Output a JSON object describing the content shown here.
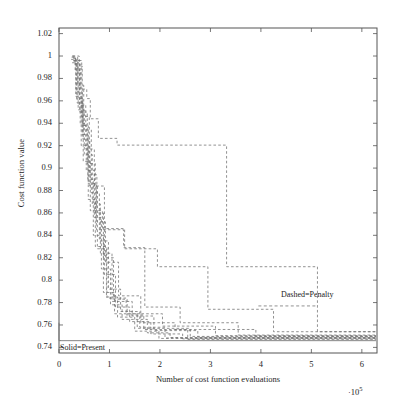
{
  "figure": {
    "background": "#ffffff",
    "frame_color": "#555555",
    "dashed_color": "#6e6e6e",
    "solid_color": "#777777"
  },
  "axes": {
    "y_label": "Cost function value",
    "x_label": "Number of cost function evaluations",
    "x_multiplier_prefix": "·",
    "x_multiplier_base": "10",
    "x_multiplier_exp": "5",
    "y_ticks": [
      "0.74",
      "0.76",
      "0.78",
      "0.8",
      "0.82",
      "0.84",
      "0.86",
      "0.88",
      "0.9",
      "0.92",
      "0.94",
      "0.96",
      "0.98",
      "1",
      "1.02"
    ],
    "x_ticks": [
      "0",
      "1",
      "2",
      "3",
      "4",
      "5",
      "6"
    ]
  },
  "annotations": [
    {
      "id": "dashed-penalty",
      "text": "Dashed=Penalty"
    },
    {
      "id": "solid-present",
      "text": "Solid=Present"
    }
  ],
  "chart_data": {
    "type": "line",
    "title": "",
    "xlabel": "Number of cost function evaluations",
    "ylabel": "Cost function value",
    "xlim": [
      0,
      6.3
    ],
    "ylim": [
      0.735,
      1.025
    ],
    "x_scale_multiplier": 100000,
    "grid": false,
    "legend": {
      "position": "inside-plot",
      "entries": [
        {
          "label": "Dashed=Penalty",
          "style": "dashed"
        },
        {
          "label": "Solid=Present",
          "style": "solid"
        }
      ]
    },
    "note": "Monotone decreasing staircase convergence histories. x in units of 1e5 cost function evaluations; y is cost function value.",
    "series": [
      {
        "name": "penalty-run-1",
        "style": "dashed",
        "x": [
          0.26,
          0.32,
          0.32,
          0.42,
          0.42,
          0.55,
          0.55,
          0.62,
          0.62,
          0.78,
          0.78,
          1.15,
          1.15,
          3.32,
          3.32,
          5.12,
          5.12,
          6.28
        ],
        "y": [
          1.0,
          1.0,
          0.9875,
          0.9875,
          0.9705,
          0.9705,
          0.962,
          0.962,
          0.944,
          0.944,
          0.9265,
          0.9265,
          0.9205,
          0.9205,
          0.812,
          0.812,
          0.754,
          0.754
        ]
      },
      {
        "name": "penalty-run-2",
        "style": "dashed",
        "x": [
          0.27,
          0.4,
          0.4,
          0.53,
          0.53,
          0.7,
          0.7,
          0.9,
          0.9,
          1.3,
          1.3,
          1.95,
          1.95,
          2.95,
          2.95,
          4.25,
          4.25,
          6.28
        ],
        "y": [
          1.0,
          1.0,
          0.956,
          0.956,
          0.917,
          0.917,
          0.884,
          0.884,
          0.846,
          0.846,
          0.828,
          0.828,
          0.812,
          0.812,
          0.774,
          0.774,
          0.754,
          0.754
        ]
      },
      {
        "name": "penalty-run-3",
        "style": "dashed",
        "x": [
          0.28,
          0.36,
          0.36,
          0.48,
          0.48,
          0.62,
          0.62,
          0.86,
          0.86,
          1.28,
          1.28,
          1.7,
          1.7,
          2.4,
          2.4,
          3.55,
          3.55,
          6.28
        ],
        "y": [
          0.998,
          0.998,
          0.958,
          0.958,
          0.906,
          0.906,
          0.862,
          0.862,
          0.845,
          0.845,
          0.829,
          0.829,
          0.776,
          0.776,
          0.762,
          0.762,
          0.751,
          0.751
        ]
      },
      {
        "name": "penalty-run-4",
        "style": "dashed",
        "x": [
          0.25,
          0.33,
          0.33,
          0.44,
          0.44,
          0.58,
          0.58,
          0.72,
          0.72,
          0.95,
          0.95,
          1.35,
          1.35,
          2.05,
          2.05,
          3.1,
          3.1,
          6.28
        ],
        "y": [
          0.999,
          0.999,
          0.964,
          0.964,
          0.92,
          0.92,
          0.872,
          0.872,
          0.83,
          0.83,
          0.784,
          0.784,
          0.77,
          0.77,
          0.759,
          0.759,
          0.7505,
          0.7505
        ]
      },
      {
        "name": "penalty-run-5",
        "style": "dashed",
        "x": [
          0.3,
          0.45,
          0.45,
          0.6,
          0.6,
          0.75,
          0.75,
          0.92,
          0.92,
          1.18,
          1.18,
          1.62,
          1.62,
          2.3,
          2.3,
          3.9,
          3.9,
          6.28
        ],
        "y": [
          0.996,
          0.996,
          0.946,
          0.946,
          0.894,
          0.894,
          0.852,
          0.852,
          0.816,
          0.816,
          0.786,
          0.786,
          0.762,
          0.762,
          0.756,
          0.756,
          0.75,
          0.75
        ]
      },
      {
        "name": "penalty-run-6",
        "style": "dashed",
        "x": [
          0.24,
          0.34,
          0.34,
          0.46,
          0.46,
          0.57,
          0.57,
          0.68,
          0.68,
          0.88,
          0.88,
          1.1,
          1.1,
          1.55,
          1.55,
          2.6,
          2.6,
          6.28
        ],
        "y": [
          0.997,
          0.997,
          0.968,
          0.968,
          0.93,
          0.93,
          0.89,
          0.89,
          0.84,
          0.84,
          0.789,
          0.789,
          0.77,
          0.77,
          0.757,
          0.757,
          0.7498,
          0.7498
        ]
      },
      {
        "name": "penalty-run-7",
        "style": "dashed",
        "x": [
          0.29,
          0.38,
          0.38,
          0.5,
          0.5,
          0.66,
          0.66,
          0.82,
          0.82,
          1.05,
          1.05,
          1.45,
          1.45,
          1.88,
          1.88,
          2.75,
          2.75,
          6.28
        ],
        "y": [
          0.995,
          0.995,
          0.952,
          0.952,
          0.912,
          0.912,
          0.868,
          0.868,
          0.824,
          0.824,
          0.781,
          0.781,
          0.768,
          0.768,
          0.755,
          0.755,
          0.7492,
          0.7492
        ]
      },
      {
        "name": "penalty-run-8",
        "style": "dashed",
        "x": [
          0.31,
          0.42,
          0.42,
          0.54,
          0.54,
          0.7,
          0.7,
          0.84,
          0.84,
          1.02,
          1.02,
          1.25,
          1.25,
          1.75,
          1.75,
          2.2,
          2.2,
          6.28
        ],
        "y": [
          0.993,
          0.993,
          0.94,
          0.94,
          0.898,
          0.898,
          0.856,
          0.856,
          0.81,
          0.81,
          0.778,
          0.778,
          0.765,
          0.765,
          0.753,
          0.753,
          0.7488,
          0.7488
        ]
      },
      {
        "name": "penalty-run-9",
        "style": "dashed",
        "x": [
          0.27,
          0.37,
          0.37,
          0.49,
          0.49,
          0.64,
          0.64,
          0.8,
          0.8,
          0.98,
          0.98,
          1.22,
          1.22,
          1.6,
          1.6,
          2.1,
          2.1,
          6.28
        ],
        "y": [
          0.999,
          0.999,
          0.974,
          0.974,
          0.934,
          0.934,
          0.878,
          0.878,
          0.835,
          0.835,
          0.792,
          0.792,
          0.772,
          0.772,
          0.758,
          0.758,
          0.7484,
          0.7484
        ]
      },
      {
        "name": "penalty-run-10",
        "style": "dashed",
        "x": [
          0.26,
          0.35,
          0.35,
          0.47,
          0.47,
          0.61,
          0.61,
          0.76,
          0.76,
          0.94,
          0.94,
          1.16,
          1.16,
          1.5,
          1.5,
          1.98,
          1.98,
          6.28
        ],
        "y": [
          0.994,
          0.994,
          0.962,
          0.962,
          0.926,
          0.926,
          0.884,
          0.884,
          0.828,
          0.828,
          0.785,
          0.785,
          0.767,
          0.767,
          0.7545,
          0.7545,
          0.748,
          0.748
        ]
      },
      {
        "name": "penalty-run-11",
        "style": "dashed",
        "x": [
          0.33,
          0.46,
          0.46,
          0.58,
          0.58,
          0.74,
          0.74,
          0.9,
          0.9,
          1.12,
          1.12,
          1.4,
          1.4,
          1.82,
          1.82,
          2.45,
          2.45,
          6.28
        ],
        "y": [
          0.991,
          0.991,
          0.938,
          0.938,
          0.886,
          0.886,
          0.845,
          0.845,
          0.805,
          0.805,
          0.776,
          0.776,
          0.763,
          0.763,
          0.752,
          0.752,
          0.7476,
          0.7476
        ]
      },
      {
        "name": "penalty-run-12",
        "style": "dashed",
        "x": [
          0.28,
          0.41,
          0.41,
          0.56,
          0.56,
          0.72,
          0.72,
          0.88,
          0.88,
          1.08,
          1.08,
          1.33,
          1.33,
          1.68,
          1.68,
          2.55,
          2.55,
          6.28
        ],
        "y": [
          0.996,
          0.996,
          0.95,
          0.95,
          0.904,
          0.904,
          0.86,
          0.86,
          0.82,
          0.82,
          0.783,
          0.783,
          0.769,
          0.769,
          0.756,
          0.756,
          0.7472,
          0.7472
        ]
      },
      {
        "name": "present-solid",
        "style": "solid",
        "x": [
          0.0,
          0.0,
          0.62,
          6.28
        ],
        "y": [
          0.762,
          0.746,
          0.746,
          0.746
        ]
      }
    ]
  }
}
